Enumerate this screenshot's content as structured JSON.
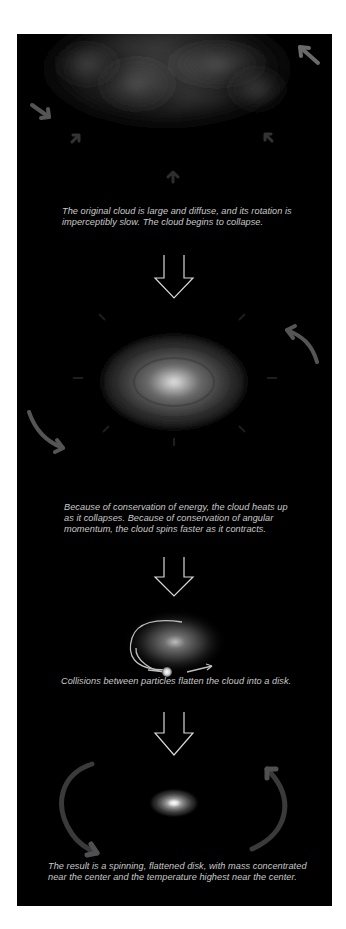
{
  "diagram": {
    "type": "process-sequence",
    "topic": "collapse of a rotating gas cloud into a spinning disk",
    "colors": {
      "page_background": "#ffffff",
      "panel_background": "#000000",
      "caption_text": "#c9c9c9",
      "down_arrow_outline": "#d8d8d8",
      "motion_arrow": "#5a5a5a"
    },
    "stages": [
      {
        "id": "stage-1",
        "illustration": "large diffuse gray cloud with inward-pointing collapse arrows",
        "caption": "The original cloud is large and diffuse, and its rotation is imperceptibly slow. The cloud begins to collapse.",
        "caption_lines": [
          "The original cloud is large and diffuse, and its rotation is",
          "imperceptibly slow. The cloud begins to collapse."
        ]
      },
      {
        "id": "stage-2",
        "illustration": "smaller glowing cloud with bright core and curved rotation arrows",
        "caption": "Because of conservation of energy, the cloud heats up as it collapses. Because of conservation of angular momentum, the cloud spins faster as it contracts.",
        "caption_lines": [
          "Because of conservation of energy, the cloud heats up",
          "as it collapses. Because of conservation of angular",
          "momentum, the cloud spins faster as it contracts."
        ]
      },
      {
        "id": "stage-3",
        "illustration": "cloud with elliptical particle orbit and colliding particle",
        "caption": "Collisions between particles flatten the cloud into a disk.",
        "caption_lines": [
          "Collisions between particles flatten the cloud into a disk."
        ]
      },
      {
        "id": "stage-4",
        "illustration": "flattened bright disk with large curved rotation arrows",
        "caption": "The result is a spinning, flattened disk, with mass concentrated near the center and the temperature highest near the center.",
        "caption_lines": [
          "The result is a spinning, flattened disk, with mass concentrated",
          "near the center and the temperature highest near the center."
        ]
      }
    ],
    "transitions": [
      {
        "from": "stage-1",
        "to": "stage-2",
        "icon": "hollow-down-arrow"
      },
      {
        "from": "stage-2",
        "to": "stage-3",
        "icon": "hollow-down-arrow"
      },
      {
        "from": "stage-3",
        "to": "stage-4",
        "icon": "hollow-down-arrow"
      }
    ]
  }
}
